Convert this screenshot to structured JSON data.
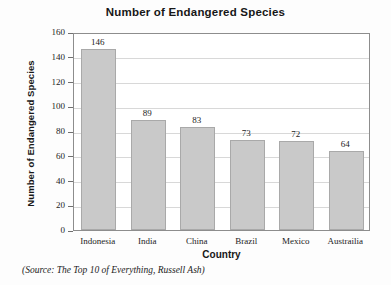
{
  "chart_data": {
    "type": "bar",
    "title": "Number of Endangered Species",
    "xlabel": "Country",
    "ylabel": "Number of Endangered Species",
    "categories": [
      "Indonesia",
      "India",
      "China",
      "Brazil",
      "Mexico",
      "Austrailia"
    ],
    "values": [
      146,
      89,
      83,
      73,
      72,
      64
    ],
    "value_labels": [
      "146",
      "89",
      "83",
      "73",
      "72",
      "64"
    ],
    "ylim": [
      0,
      160
    ],
    "ytick_step": 20,
    "ytick_labels": [
      "0",
      "20",
      "40",
      "60",
      "80",
      "100",
      "120",
      "140",
      "160"
    ],
    "grid": true,
    "legend": false,
    "bar_color": "#c9c9c9",
    "bar_edge_color": "#a9a9a9",
    "axis_color": "#8d8d8d",
    "gridline_color": "#d8d8d8"
  },
  "source_note": "(Source: The Top 10 of Everything, Russell Ash)"
}
